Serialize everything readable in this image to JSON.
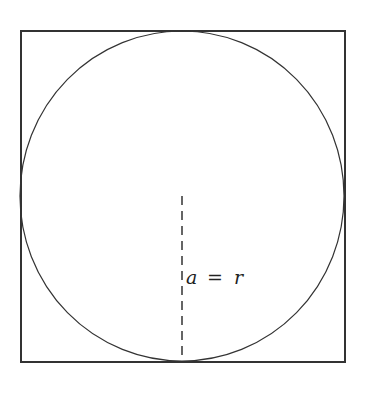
{
  "diagram": {
    "label": "a = r",
    "label_parts": {
      "left": "a",
      "op": "=",
      "right": "r"
    },
    "colors": {
      "stroke": "#333333",
      "background": "#ffffff"
    },
    "square": {
      "x": 21,
      "y": 31,
      "width": 324,
      "height": 331
    },
    "circle": {
      "cx": 182,
      "cy": 196,
      "rx": 162,
      "ry": 165
    },
    "radius_line": {
      "x": 182,
      "y1": 196,
      "y2": 362,
      "style": "dashed"
    }
  }
}
